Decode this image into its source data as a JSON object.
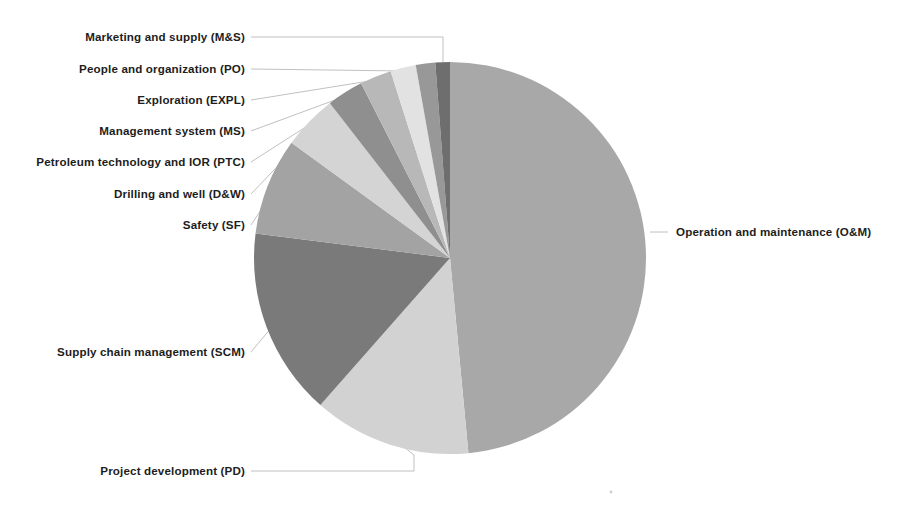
{
  "figure": {
    "background": "#ffffff",
    "width": 897,
    "height": 509
  },
  "chart_data": {
    "type": "pie",
    "title": "",
    "subtitle": "",
    "xlabel": "",
    "ylabel": "",
    "legend_position": "none",
    "grid": false,
    "label_style": "outside-with-leader-lines",
    "start_angle_deg": -90,
    "direction": "clockwise",
    "center": [
      450,
      258
    ],
    "radius": 196,
    "categories": [
      "Operation and maintenance (O&M)",
      "Project development (PD)",
      "Supply chain management (SCM)",
      "Safety (SF)",
      "Drilling and well (D&W)",
      "Petroleum technology and IOR (PTC)",
      "Management system (MS)",
      "Exploration (EXPL)",
      "People and organization (PO)",
      "Marketing and supply (M&S)"
    ],
    "short_names": [
      "O&M",
      "PD",
      "SCM",
      "SF",
      "D&W",
      "PTC",
      "MS",
      "EXPL",
      "PO",
      "M&S"
    ],
    "values": [
      48.5,
      13.0,
      15.5,
      8.0,
      4.5,
      3.0,
      2.6,
      2.1,
      1.6,
      1.2
    ],
    "colors": [
      "#a8a8a8",
      "#d2d2d2",
      "#7a7a7a",
      "#a3a3a3",
      "#d4d4d4",
      "#8f8f8f",
      "#b8b8b8",
      "#e2e2e2",
      "#989898",
      "#6e6e6e"
    ]
  },
  "labels": [
    {
      "id": "ms",
      "text": "Marketing and supply (M&S)",
      "side": "left",
      "x": 245,
      "y": 41
    },
    {
      "id": "po",
      "text": "People and organization (PO)",
      "side": "left",
      "x": 245,
      "y": 73
    },
    {
      "id": "expl",
      "text": "Exploration (EXPL)",
      "side": "left",
      "x": 245,
      "y": 104
    },
    {
      "id": "mgmt",
      "text": "Management system (MS)",
      "side": "left",
      "x": 245,
      "y": 135
    },
    {
      "id": "ptc",
      "text": "Petroleum technology and IOR (PTC)",
      "side": "left",
      "x": 245,
      "y": 166
    },
    {
      "id": "dw",
      "text": "Drilling and well (D&W)",
      "side": "left",
      "x": 245,
      "y": 198
    },
    {
      "id": "sf",
      "text": "Safety (SF)",
      "side": "left",
      "x": 245,
      "y": 229
    },
    {
      "id": "scm",
      "text": "Supply chain management (SCM)",
      "side": "left",
      "x": 245,
      "y": 356
    },
    {
      "id": "pd",
      "text": "Project development (PD)",
      "side": "left",
      "x": 245,
      "y": 475
    },
    {
      "id": "om",
      "text": "Operation and maintenance (O&M)",
      "side": "right",
      "x": 676,
      "y": 236
    }
  ]
}
